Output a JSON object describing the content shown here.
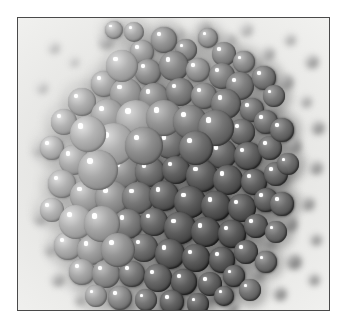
{
  "figure": {
    "kind": "photomicrograph",
    "frame": {
      "border_color": "#4a4a4a",
      "page_background": "#ffffff"
    },
    "palette": {
      "background_light": "#f6f6f4",
      "background_mid": "#d9d9d6",
      "sphere_light": "#b9b9b4",
      "sphere_mid": "#8d8d88",
      "sphere_dark": "#5a5a57",
      "sphere_darkest": "#2e2e2c",
      "highlight": "#ffffff"
    }
  },
  "chart_data": {
    "type": "scatter",
    "title": "",
    "xlabel": "",
    "ylabel": "",
    "xlim": [
      0,
      313
    ],
    "ylim": [
      0,
      294
    ],
    "grid": false,
    "legend": "none",
    "fields": [
      "x",
      "y",
      "r",
      "g"
    ],
    "background_particles": [
      [
        36,
        30,
        5,
        196
      ],
      [
        56,
        44,
        4,
        200
      ],
      [
        88,
        24,
        7,
        176
      ],
      [
        108,
        36,
        5,
        190
      ],
      [
        140,
        18,
        6,
        182
      ],
      [
        24,
        70,
        5,
        198
      ],
      [
        60,
        84,
        4,
        201
      ],
      [
        96,
        70,
        5,
        188
      ],
      [
        132,
        60,
        7,
        170
      ],
      [
        46,
        110,
        6,
        186
      ],
      [
        20,
        132,
        5,
        196
      ],
      [
        250,
        36,
        6,
        168
      ],
      [
        272,
        22,
        5,
        178
      ],
      [
        294,
        44,
        6,
        160
      ],
      [
        268,
        64,
        7,
        156
      ],
      [
        288,
        84,
        5,
        170
      ],
      [
        300,
        110,
        6,
        150
      ],
      [
        252,
        96,
        5,
        166
      ],
      [
        236,
        48,
        6,
        172
      ],
      [
        276,
        128,
        7,
        146
      ],
      [
        298,
        150,
        6,
        152
      ],
      [
        262,
        160,
        7,
        140
      ],
      [
        290,
        186,
        6,
        148
      ],
      [
        272,
        206,
        7,
        138
      ],
      [
        298,
        222,
        5,
        150
      ],
      [
        252,
        224,
        6,
        142
      ],
      [
        276,
        244,
        7,
        136
      ],
      [
        240,
        256,
        6,
        144
      ],
      [
        296,
        262,
        5,
        148
      ],
      [
        262,
        276,
        6,
        140
      ],
      [
        40,
        262,
        6,
        168
      ],
      [
        62,
        282,
        5,
        174
      ],
      [
        88,
        270,
        6,
        160
      ],
      [
        110,
        288,
        6,
        154
      ],
      [
        32,
        232,
        5,
        178
      ],
      [
        22,
        200,
        6,
        182
      ],
      [
        140,
        290,
        6,
        148
      ],
      [
        166,
        292,
        5,
        152
      ],
      [
        190,
        280,
        6,
        142
      ],
      [
        214,
        290,
        6,
        146
      ],
      [
        160,
        16,
        5,
        186
      ],
      [
        186,
        10,
        6,
        176
      ],
      [
        212,
        22,
        5,
        180
      ],
      [
        228,
        12,
        6,
        186
      ]
    ],
    "spheres": [
      [
        146,
        22,
        13,
        150
      ],
      [
        168,
        32,
        11,
        142
      ],
      [
        190,
        20,
        10,
        156
      ],
      [
        206,
        36,
        12,
        138
      ],
      [
        124,
        34,
        12,
        160
      ],
      [
        104,
        48,
        14,
        168
      ],
      [
        130,
        54,
        13,
        146
      ],
      [
        156,
        48,
        15,
        134
      ],
      [
        180,
        52,
        12,
        150
      ],
      [
        204,
        58,
        13,
        130
      ],
      [
        226,
        44,
        11,
        144
      ],
      [
        222,
        68,
        14,
        126
      ],
      [
        86,
        66,
        13,
        172
      ],
      [
        108,
        76,
        16,
        158
      ],
      [
        136,
        80,
        15,
        140
      ],
      [
        162,
        74,
        14,
        128
      ],
      [
        186,
        78,
        13,
        136
      ],
      [
        208,
        86,
        15,
        120
      ],
      [
        234,
        92,
        12,
        118
      ],
      [
        64,
        84,
        14,
        176
      ],
      [
        90,
        98,
        17,
        166
      ],
      [
        118,
        102,
        18,
        152
      ],
      [
        146,
        100,
        16,
        132
      ],
      [
        172,
        104,
        15,
        124
      ],
      [
        198,
        110,
        16,
        112
      ],
      [
        224,
        114,
        13,
        110
      ],
      [
        248,
        104,
        12,
        116
      ],
      [
        46,
        104,
        13,
        180
      ],
      [
        70,
        116,
        16,
        170
      ],
      [
        96,
        126,
        18,
        160
      ],
      [
        126,
        128,
        17,
        138
      ],
      [
        152,
        126,
        15,
        118
      ],
      [
        178,
        130,
        16,
        108
      ],
      [
        204,
        136,
        15,
        104
      ],
      [
        230,
        138,
        14,
        100
      ],
      [
        252,
        130,
        12,
        108
      ],
      [
        34,
        130,
        12,
        184
      ],
      [
        56,
        142,
        15,
        174
      ],
      [
        80,
        152,
        17,
        164
      ],
      [
        106,
        154,
        16,
        142
      ],
      [
        132,
        154,
        15,
        114
      ],
      [
        158,
        152,
        14,
        98
      ],
      [
        184,
        158,
        16,
        96
      ],
      [
        210,
        162,
        15,
        94
      ],
      [
        236,
        164,
        13,
        98
      ],
      [
        258,
        156,
        12,
        104
      ],
      [
        44,
        166,
        14,
        178
      ],
      [
        68,
        178,
        16,
        168
      ],
      [
        94,
        180,
        17,
        150
      ],
      [
        120,
        180,
        16,
        120
      ],
      [
        146,
        178,
        15,
        100
      ],
      [
        172,
        184,
        16,
        92
      ],
      [
        198,
        188,
        15,
        90
      ],
      [
        224,
        190,
        14,
        92
      ],
      [
        248,
        182,
        12,
        100
      ],
      [
        34,
        192,
        12,
        182
      ],
      [
        58,
        204,
        15,
        172
      ],
      [
        84,
        206,
        16,
        154
      ],
      [
        110,
        206,
        15,
        126
      ],
      [
        136,
        204,
        14,
        104
      ],
      [
        162,
        210,
        16,
        94
      ],
      [
        188,
        214,
        15,
        88
      ],
      [
        214,
        216,
        14,
        90
      ],
      [
        238,
        208,
        12,
        98
      ],
      [
        50,
        228,
        14,
        176
      ],
      [
        74,
        232,
        15,
        160
      ],
      [
        100,
        232,
        15,
        132
      ],
      [
        126,
        230,
        14,
        110
      ],
      [
        152,
        236,
        15,
        96
      ],
      [
        178,
        240,
        14,
        90
      ],
      [
        204,
        242,
        13,
        92
      ],
      [
        228,
        234,
        12,
        100
      ],
      [
        64,
        254,
        13,
        168
      ],
      [
        88,
        256,
        14,
        146
      ],
      [
        114,
        256,
        13,
        120
      ],
      [
        140,
        260,
        14,
        102
      ],
      [
        166,
        264,
        13,
        94
      ],
      [
        192,
        266,
        12,
        96
      ],
      [
        216,
        258,
        11,
        102
      ],
      [
        78,
        278,
        11,
        162
      ],
      [
        102,
        280,
        12,
        140
      ],
      [
        128,
        282,
        11,
        116
      ],
      [
        154,
        284,
        12,
        100
      ],
      [
        180,
        286,
        11,
        98
      ],
      [
        246,
        60,
        12,
        126
      ],
      [
        256,
        78,
        11,
        122
      ],
      [
        264,
        112,
        12,
        112
      ],
      [
        270,
        146,
        11,
        110
      ],
      [
        264,
        186,
        12,
        108
      ],
      [
        258,
        214,
        11,
        112
      ],
      [
        248,
        244,
        11,
        118
      ],
      [
        232,
        272,
        11,
        116
      ],
      [
        206,
        278,
        10,
        108
      ],
      [
        116,
        14,
        10,
        168
      ],
      [
        96,
        12,
        9,
        176
      ]
    ],
    "big_spheres": [
      [
        104,
        48,
        16,
        178
      ],
      [
        118,
        102,
        20,
        172
      ],
      [
        96,
        126,
        21,
        176
      ],
      [
        80,
        152,
        20,
        170
      ],
      [
        146,
        100,
        18,
        150
      ],
      [
        126,
        128,
        19,
        144
      ],
      [
        70,
        116,
        18,
        182
      ],
      [
        58,
        204,
        17,
        180
      ],
      [
        84,
        206,
        18,
        166
      ],
      [
        100,
        232,
        17,
        150
      ],
      [
        172,
        104,
        17,
        128
      ],
      [
        198,
        110,
        18,
        118
      ],
      [
        178,
        130,
        17,
        112
      ]
    ]
  }
}
